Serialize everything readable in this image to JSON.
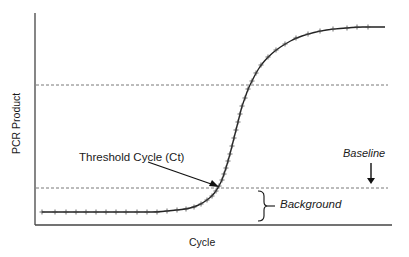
{
  "chart_data": {
    "type": "line",
    "title": "",
    "xlabel": "Cycle",
    "ylabel": "PCR Product",
    "grid": false,
    "legend": null,
    "annotations": [
      {
        "text": "Threshold Cycle (Ct)",
        "style": "normal",
        "points_to": "intersection of amplification curve and threshold line"
      },
      {
        "text": "Baseline",
        "style": "italic",
        "arrow": "down",
        "points_to": "lower dashed threshold line"
      },
      {
        "text": "Background",
        "style": "italic",
        "bracket": "right curly brace spanning baseline fluorescence region"
      }
    ],
    "reference_lines": [
      {
        "name": "plateau-reference",
        "orientation": "horizontal",
        "style": "dashed",
        "y_px": 85
      },
      {
        "name": "threshold-baseline",
        "orientation": "horizontal",
        "style": "dashed",
        "y_px": 188
      }
    ],
    "series": [
      {
        "name": "amplification-curve",
        "marker": "+",
        "description": "sigmoidal PCR amplification curve: flat background, exponential rise crossing threshold, plateau",
        "points_px": [
          [
            42,
            212
          ],
          [
            55,
            212
          ],
          [
            66,
            212
          ],
          [
            76,
            212
          ],
          [
            86,
            212
          ],
          [
            96,
            212
          ],
          [
            106,
            212
          ],
          [
            116,
            212
          ],
          [
            126,
            212
          ],
          [
            137,
            212
          ],
          [
            147,
            212
          ],
          [
            157,
            212
          ],
          [
            167,
            211
          ],
          [
            177,
            210
          ],
          [
            186,
            209
          ],
          [
            194,
            207
          ],
          [
            201,
            204
          ],
          [
            207,
            200
          ],
          [
            212,
            196
          ],
          [
            216,
            191
          ],
          [
            219,
            186
          ],
          [
            222,
            180
          ],
          [
            224,
            174
          ],
          [
            226,
            168
          ],
          [
            228,
            161
          ],
          [
            230,
            154
          ],
          [
            232,
            146
          ],
          [
            234,
            138
          ],
          [
            236,
            130
          ],
          [
            238,
            122
          ],
          [
            240,
            114
          ],
          [
            242,
            106
          ],
          [
            245,
            98
          ],
          [
            248,
            89
          ],
          [
            252,
            81
          ],
          [
            256,
            73
          ],
          [
            261,
            65
          ],
          [
            268,
            57
          ],
          [
            276,
            50
          ],
          [
            285,
            44
          ],
          [
            296,
            38
          ],
          [
            308,
            34
          ],
          [
            320,
            31
          ],
          [
            333,
            29
          ],
          [
            347,
            28
          ],
          [
            357,
            27
          ],
          [
            368,
            27
          ],
          [
            385,
            27
          ]
        ]
      }
    ],
    "axes": {
      "x_start_px": 35,
      "x_end_px": 392,
      "y_top_px": 13,
      "y_bottom_px": 225
    }
  },
  "labels": {
    "ylabel": "PCR Product",
    "xlabel": "Cycle",
    "threshold": "Threshold Cycle (Ct)",
    "baseline": "Baseline",
    "background": "Background"
  }
}
